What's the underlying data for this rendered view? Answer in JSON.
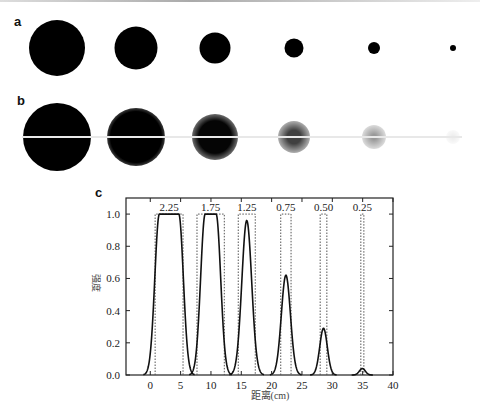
{
  "panels": {
    "a": {
      "label": "a"
    },
    "b": {
      "label": "b"
    },
    "c": {
      "label": "c"
    }
  },
  "panel_a_dots": [
    {
      "cx": 57,
      "cy": 48,
      "d": 56
    },
    {
      "cx": 136,
      "cy": 48,
      "d": 43
    },
    {
      "cx": 215,
      "cy": 48,
      "d": 31
    },
    {
      "cx": 294,
      "cy": 48,
      "d": 19
    },
    {
      "cx": 374,
      "cy": 48,
      "d": 12
    },
    {
      "cx": 453,
      "cy": 48,
      "d": 6
    }
  ],
  "panel_b_dots": [
    {
      "cx": 57,
      "cy": 137,
      "d": 68,
      "core": 0.72,
      "opacity": 1.0
    },
    {
      "cx": 136,
      "cy": 137,
      "d": 58,
      "core": 0.62,
      "opacity": 1.0
    },
    {
      "cx": 215,
      "cy": 137,
      "d": 46,
      "core": 0.5,
      "opacity": 0.98
    },
    {
      "cx": 294,
      "cy": 137,
      "d": 32,
      "core": 0.3,
      "opacity": 0.75
    },
    {
      "cx": 374,
      "cy": 137,
      "d": 24,
      "core": 0.15,
      "opacity": 0.4
    },
    {
      "cx": 453,
      "cy": 137,
      "d": 14,
      "core": 0.0,
      "opacity": 0.08
    }
  ],
  "chart_data": {
    "type": "line",
    "title": "",
    "xlabel": "距离(cm)",
    "ylabel": "强度",
    "xlim": [
      -4,
      40
    ],
    "ylim": [
      0,
      1.1
    ],
    "xticks": [
      0,
      5,
      10,
      15,
      20,
      25,
      30,
      35,
      40
    ],
    "xtick_labels": [
      "0",
      "5",
      "10",
      "15",
      "20",
      "25",
      "30",
      "35",
      "40"
    ],
    "yticks": [
      0.0,
      0.2,
      0.4,
      0.6,
      0.8,
      1.0
    ],
    "ytick_labels": [
      "0.0",
      "0.2",
      "0.4",
      "0.6",
      "0.8",
      "1.0"
    ],
    "grid": false,
    "legend": null,
    "annotations": [
      "2.25",
      "1.75",
      "1.25",
      "0.75",
      "0.50",
      "0.25"
    ],
    "series": [
      {
        "name": "ideal (dotted rectangles)",
        "style": "dotted",
        "rects": [
          {
            "label": "2.25",
            "x0": 0.8,
            "x1": 5.4,
            "height": 1.0
          },
          {
            "label": "1.75",
            "x0": 7.7,
            "x1": 12.2,
            "height": 1.0
          },
          {
            "label": "1.25",
            "x0": 14.5,
            "x1": 17.3,
            "height": 1.0
          },
          {
            "label": "0.75",
            "x0": 21.5,
            "x1": 23.2,
            "height": 1.0
          },
          {
            "label": "0.50",
            "x0": 28.0,
            "x1": 29.1,
            "height": 1.0
          },
          {
            "label": "0.25",
            "x0": 34.7,
            "x1": 35.2,
            "height": 1.0
          }
        ]
      },
      {
        "name": "measured (solid curves)",
        "style": "solid",
        "peaks": [
          {
            "label": "2.25",
            "center": 3.1,
            "height": 1.0,
            "flat_half": 1.6,
            "edge": 1.2
          },
          {
            "label": "1.75",
            "center": 9.95,
            "height": 1.0,
            "flat_half": 0.9,
            "edge": 1.2
          },
          {
            "label": "1.25",
            "center": 15.9,
            "height": 0.96,
            "flat_half": 0.0,
            "edge": 1.3
          },
          {
            "label": "0.75",
            "center": 22.35,
            "height": 0.62,
            "flat_half": 0.0,
            "edge": 1.2
          },
          {
            "label": "0.50",
            "center": 28.55,
            "height": 0.29,
            "flat_half": 0.0,
            "edge": 1.0
          },
          {
            "label": "0.25",
            "center": 34.95,
            "height": 0.04,
            "flat_half": 0.0,
            "edge": 0.8
          }
        ]
      }
    ]
  }
}
